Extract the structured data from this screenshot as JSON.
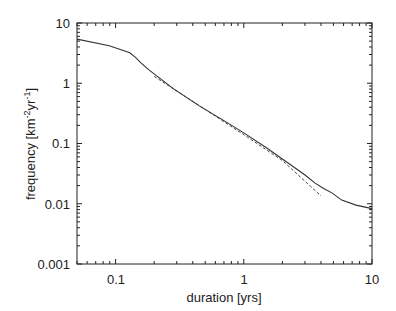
{
  "chart_data": {
    "type": "line",
    "title": "",
    "xlabel": "duration [yrs]",
    "ylabel": "frequency [km⁻²yr⁻¹]",
    "xscale": "log",
    "yscale": "log",
    "xlim": [
      0.05,
      10
    ],
    "ylim": [
      0.001,
      10
    ],
    "grid": false,
    "legend": null,
    "xticks": [
      "0.1",
      "1",
      "10"
    ],
    "yticks": [
      "0.001",
      "0.01",
      "0.1",
      "1",
      "10"
    ],
    "series": [
      {
        "name": "observed",
        "style": "solid",
        "x": [
          0.05,
          0.0893,
          0.129,
          0.143,
          0.157,
          0.18,
          0.28,
          0.45,
          0.7,
          1.0,
          1.5,
          2.2,
          3.0,
          3.6,
          4.2,
          4.9,
          5.8,
          7.5,
          10.0
        ],
        "y": [
          5.4,
          4.2,
          3.2,
          2.7,
          2.2,
          1.7,
          0.82,
          0.42,
          0.24,
          0.15,
          0.085,
          0.048,
          0.03,
          0.022,
          0.018,
          0.015,
          0.0115,
          0.0095,
          0.0083
        ]
      },
      {
        "name": "power-law fit",
        "style": "dashed",
        "x": [
          0.2,
          0.4,
          1.0,
          2.0,
          4.0
        ],
        "y": [
          1.3,
          0.5,
          0.14,
          0.052,
          0.0135
        ]
      }
    ]
  },
  "axes": {
    "x_tick_labels": [
      "0.1",
      "1",
      "10"
    ],
    "y_tick_labels": [
      "10",
      "1",
      "0.1",
      "0.01",
      "0.001"
    ],
    "xlabel": "duration [yrs]",
    "ylabel_main": "frequency [km",
    "ylabel_sup1": "-2",
    "ylabel_mid": "yr",
    "ylabel_sup2": "-1",
    "ylabel_end": "]"
  }
}
